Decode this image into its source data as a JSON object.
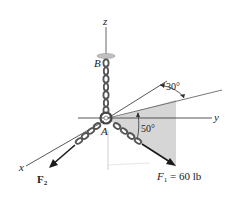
{
  "diagram": {
    "axes": {
      "x": "x",
      "y": "y",
      "z": "z"
    },
    "points": {
      "A": "A",
      "B": "B"
    },
    "angles": {
      "azimuth": "30°",
      "elevation": "50°"
    },
    "forces": {
      "F1": {
        "symbol": "F",
        "subscript": "1",
        "value_text": " = 60 lb"
      },
      "F2": {
        "symbol": "F",
        "subscript": "2"
      }
    },
    "colors": {
      "plane_fill": "#d6d6d6",
      "axis_line": "#444444",
      "chain": "#555555",
      "arrow": "#1a1a1a"
    }
  }
}
